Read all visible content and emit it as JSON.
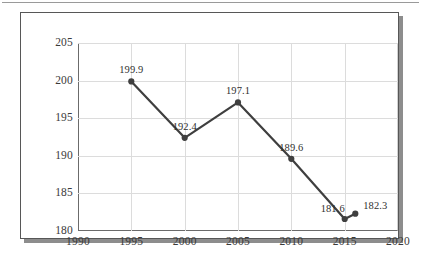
{
  "figure": {
    "accent_line_color": "#3f3f3f",
    "grid_color": "#dcdcdc",
    "axis_color": "#6b6b6b",
    "text_color": "#3a3a3a"
  },
  "chart_data": {
    "type": "line",
    "title": "",
    "subtitle": "",
    "xlabel": "",
    "ylabel": "",
    "xlim": [
      1990,
      2020
    ],
    "ylim": [
      180,
      205
    ],
    "xticks": [
      1990,
      1995,
      2000,
      2005,
      2010,
      2015,
      2020
    ],
    "xtick_labels": [
      "1990",
      "1995",
      "2000",
      "2005",
      "2010",
      "2015",
      "2020"
    ],
    "yticks": [
      180,
      185,
      190,
      195,
      200,
      205
    ],
    "ytick_labels": [
      "180",
      "185",
      "190",
      "195",
      "200",
      "205"
    ],
    "grid": true,
    "legend": null,
    "legend_position": "none",
    "markers": true,
    "x": [
      1995,
      2000,
      2005,
      2010,
      2015,
      2016
    ],
    "values": [
      199.9,
      192.4,
      197.1,
      189.6,
      181.6,
      182.3
    ],
    "point_labels": [
      "199.9",
      "192.4",
      "197.1",
      "189.6",
      "181.6",
      "182.3"
    ],
    "label_positions": [
      "above",
      "above",
      "above",
      "above",
      "above-left",
      "above-right"
    ]
  }
}
